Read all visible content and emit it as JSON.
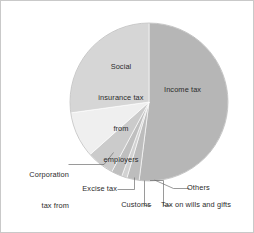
{
  "chart_data": {
    "type": "pie",
    "title": "",
    "subtitle": "",
    "xlabel": "",
    "ylabel": "",
    "legend_position": "none",
    "grid": false,
    "start_angle_deg": 0,
    "direction": "clockwise",
    "center": {
      "x": 148,
      "y": 101
    },
    "radius": 79,
    "categories": [
      "Income tax",
      "Others",
      "Tax on wills and gifts",
      "Customs",
      "Excise tax",
      "Corporation tax from companies",
      "Social insurance tax from employers"
    ],
    "values": [
      52.0,
      2.5,
      1.1,
      2.2,
      5.6,
      9.4,
      27.2
    ],
    "units": "percent",
    "slices": [
      {
        "label": "Income tax",
        "value": 52.0,
        "start_deg": 0,
        "end_deg": 187.2,
        "color": "#b6b6b6",
        "label_placement": "inside"
      },
      {
        "label": "Others",
        "value": 2.5,
        "start_deg": 187.2,
        "end_deg": 196.2,
        "color": "#bdbdbd",
        "label_placement": "callout"
      },
      {
        "label": "Tax on wills and gifts",
        "value": 1.1,
        "start_deg": 196.2,
        "end_deg": 200.2,
        "color": "#d2d2d2",
        "label_placement": "callout"
      },
      {
        "label": "Customs",
        "value": 2.2,
        "start_deg": 200.2,
        "end_deg": 208.1,
        "color": "#bfbfbf",
        "label_placement": "callout"
      },
      {
        "label": "Excise tax",
        "value": 5.6,
        "start_deg": 208.1,
        "end_deg": 228.3,
        "color": "#cbcbcb",
        "label_placement": "callout"
      },
      {
        "label": "Corporation tax from companies",
        "value": 9.4,
        "start_deg": 228.3,
        "end_deg": 262.1,
        "color": "#efefef",
        "label_placement": "callout"
      },
      {
        "label": "Social insurance tax from employers",
        "value": 27.2,
        "start_deg": 262.1,
        "end_deg": 360,
        "color": "#d6d6d6",
        "label_placement": "inside"
      }
    ],
    "labels": {
      "income_tax": "Income tax",
      "social_line1": "Social",
      "social_line2": "insurance tax",
      "social_line3": "from",
      "social_line4": "employers",
      "corporation_line1": "Corporation",
      "corporation_line2": "tax from",
      "corporation_line3": "companies",
      "excise_tax": "Excise tax",
      "customs": "Customs",
      "wills_and_gifts": "Tax on wills and gifts",
      "others": "Others"
    },
    "colors": {
      "income_tax": "#b6b6b6",
      "others": "#bdbdbd",
      "wills_and_gifts": "#d2d2d2",
      "customs": "#bfbfbf",
      "excise_tax": "#cbcbcb",
      "corporation_tax": "#efefef",
      "social_insurance": "#d6d6d6",
      "outline": "#9a9a9a",
      "leader_line": "#6f6f6f",
      "text": "#2b2b2b",
      "background": "#ffffff",
      "page_border": "#c9c9c9"
    }
  }
}
